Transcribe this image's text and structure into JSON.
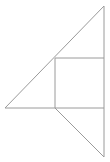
{
  "figure": {
    "background_color": "#ffffff",
    "stroke_color": "#9a9a9a",
    "stroke_width": 1,
    "canvas": {
      "width": 110,
      "height": 162
    },
    "points": {
      "left_vertex": {
        "x": 5,
        "y": 108
      },
      "top_apex": {
        "x": 104,
        "y": 6
      },
      "right_angle_corner": {
        "x": 104,
        "y": 108
      },
      "square_top_left": {
        "x": 55,
        "y": 58
      },
      "square_top_right": {
        "x": 104,
        "y": 58
      },
      "square_bottom_left": {
        "x": 55,
        "y": 108
      },
      "square_bottom_right": {
        "x": 104,
        "y": 108
      },
      "bottom_vertex": {
        "x": 104,
        "y": 157
      }
    },
    "shapes": [
      {
        "name": "upper-triangle",
        "kind": "polygon",
        "points": "5,108 104,6 104,108"
      },
      {
        "name": "inscribed-square",
        "kind": "polygon",
        "points": "55,58 104,58 104,108 55,108"
      },
      {
        "name": "lower-triangle",
        "kind": "polygon",
        "points": "55,108 104,108 104,157"
      }
    ],
    "segments": [
      {
        "name": "baseline",
        "x1": 5,
        "y1": 108,
        "x2": 104,
        "y2": 108
      },
      {
        "name": "upper-hypotenuse",
        "x1": 5,
        "y1": 108,
        "x2": 104,
        "y2": 6
      },
      {
        "name": "right-vertical-upper",
        "x1": 104,
        "y1": 6,
        "x2": 104,
        "y2": 108
      },
      {
        "name": "square-top-edge",
        "x1": 55,
        "y1": 58,
        "x2": 104,
        "y2": 58
      },
      {
        "name": "square-left-edge",
        "x1": 55,
        "y1": 58,
        "x2": 55,
        "y2": 108
      },
      {
        "name": "right-vertical-lower",
        "x1": 104,
        "y1": 108,
        "x2": 104,
        "y2": 157
      },
      {
        "name": "lower-hypotenuse",
        "x1": 55,
        "y1": 108,
        "x2": 104,
        "y2": 157
      }
    ]
  }
}
